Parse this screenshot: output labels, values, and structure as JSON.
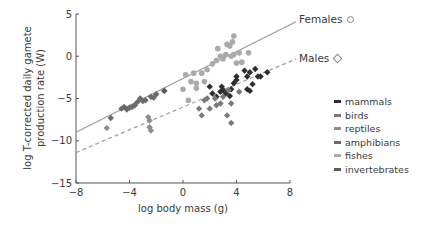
{
  "chart_data": {
    "type": "scatter",
    "title": "",
    "xlabel": "log body mass (g)",
    "ylabel_line1": "log T-corrected daily gamete",
    "ylabel_line2": "production rate  (W)",
    "xlim": [
      -8,
      8
    ],
    "ylim": [
      -15,
      5
    ],
    "xticks": [
      -8,
      -4,
      0,
      4,
      8
    ],
    "xtick_labels": [
      "−8",
      "−4",
      "0",
      "4",
      "8"
    ],
    "yticks": [
      5,
      0,
      -5,
      -10,
      -15
    ],
    "ytick_labels": [
      "5",
      "0",
      "−5",
      "−10",
      "−15"
    ],
    "grid": false,
    "legend_position": "right",
    "fit_lines": [
      {
        "name": "Females",
        "marker": "circle",
        "style": "solid",
        "color": "#9a9a9a",
        "x": [
          -8,
          8
        ],
        "y": [
          -9.0,
          3.6
        ]
      },
      {
        "name": "Males",
        "marker": "diamond",
        "style": "dashed",
        "color": "#a0a0a0",
        "x": [
          -8,
          8
        ],
        "y": [
          -11.4,
          -0.8
        ]
      }
    ],
    "series": [
      {
        "name": "mammals",
        "color": "#2e2e2e",
        "marker": "diamond",
        "points": [
          [
            2.0,
            -3.6
          ],
          [
            2.5,
            -4.8
          ],
          [
            2.8,
            -4.2
          ],
          [
            2.9,
            -3.6
          ],
          [
            3.2,
            -4.4
          ],
          [
            3.5,
            -4.7
          ],
          [
            3.6,
            -3.9
          ],
          [
            3.8,
            -3.2
          ],
          [
            4.0,
            -2.8
          ],
          [
            4.0,
            -2.4
          ],
          [
            4.6,
            -1.7
          ],
          [
            4.8,
            -2.4
          ],
          [
            4.8,
            -3.9
          ],
          [
            5.0,
            -4.1
          ],
          [
            5.0,
            -1.9
          ],
          [
            5.2,
            -3.3
          ],
          [
            5.4,
            -1.5
          ],
          [
            5.6,
            -2.4
          ],
          [
            5.8,
            -2.4
          ],
          [
            6.3,
            -1.9
          ],
          [
            2.2,
            -4.4
          ],
          [
            3.0,
            -4.0
          ]
        ]
      },
      {
        "name": "birds",
        "color": "#7a7a7a",
        "marker": "diamond",
        "points": [
          [
            1.4,
            -7.0
          ],
          [
            1.2,
            -6.2
          ],
          [
            1.6,
            -5.2
          ],
          [
            2.0,
            -6.2
          ],
          [
            2.5,
            -5.8
          ],
          [
            2.8,
            -5.6
          ],
          [
            3.3,
            -7.0
          ],
          [
            3.6,
            -7.9
          ],
          [
            3.6,
            -5.6
          ],
          [
            1.8,
            -5.0
          ],
          [
            2.4,
            -5.0
          ],
          [
            3.0,
            -4.8
          ],
          [
            3.4,
            -4.0
          ],
          [
            4.2,
            -4.2
          ]
        ]
      },
      {
        "name": "reptiles",
        "color": "#8c8c8c",
        "marker": "diamond",
        "points": [
          [
            -2.5,
            -7.6
          ],
          [
            -2.5,
            -8.4
          ],
          [
            -2.4,
            -8.8
          ],
          [
            -2.6,
            -7.2
          ],
          [
            -5.7,
            -8.5
          ],
          [
            -1.4,
            -4.1
          ]
        ]
      },
      {
        "name": "amphibians",
        "color": "#6a6a6a",
        "marker": "diamond",
        "points": [
          [
            -4.6,
            -6.2
          ],
          [
            -4.4,
            -6.0
          ],
          [
            -4.2,
            -6.3
          ],
          [
            -4.0,
            -6.1
          ],
          [
            -3.8,
            -6.0
          ],
          [
            -3.6,
            -5.8
          ],
          [
            -3.2,
            -5.0
          ],
          [
            -3.0,
            -5.3
          ],
          [
            -2.8,
            -5.2
          ],
          [
            -2.4,
            -4.8
          ],
          [
            -2.2,
            -4.9
          ],
          [
            -2.0,
            -4.5
          ],
          [
            -5.4,
            -7.3
          ],
          [
            -3.4,
            -5.4
          ]
        ]
      },
      {
        "name": "fishes",
        "color": "#aaaaaa",
        "marker": "circle",
        "points": [
          [
            0.2,
            -2.2
          ],
          [
            0.6,
            -3.0
          ],
          [
            1.0,
            -3.2
          ],
          [
            1.4,
            -2.0
          ],
          [
            1.8,
            -1.6
          ],
          [
            2.2,
            -0.9
          ],
          [
            2.5,
            -0.5
          ],
          [
            2.6,
            0.9
          ],
          [
            2.8,
            0.0
          ],
          [
            3.0,
            -0.3
          ],
          [
            3.2,
            0.2
          ],
          [
            3.3,
            1.4
          ],
          [
            3.5,
            1.2
          ],
          [
            3.6,
            0.0
          ],
          [
            3.7,
            1.7
          ],
          [
            3.8,
            0.2
          ],
          [
            3.8,
            2.4
          ],
          [
            4.0,
            -0.8
          ],
          [
            4.2,
            0.4
          ],
          [
            4.4,
            -0.7
          ],
          [
            4.9,
            0.4
          ],
          [
            0.0,
            -3.9
          ],
          [
            0.4,
            -5.2
          ],
          [
            1.0,
            -3.8
          ],
          [
            0.8,
            -2.0
          ],
          [
            1.6,
            -3.0
          ]
        ]
      },
      {
        "name": "invertebrates",
        "color": "#5a5a5a",
        "marker": "diamond",
        "points": [
          [
            -1.4,
            -4.1
          ]
        ]
      }
    ]
  },
  "legend": {
    "items": [
      {
        "label": "mammals",
        "color": "#2e2e2e"
      },
      {
        "label": "birds",
        "color": "#7a7a7a"
      },
      {
        "label": "reptiles",
        "color": "#8c8c8c"
      },
      {
        "label": "amphibians",
        "color": "#6a6a6a"
      },
      {
        "label": "fishes",
        "color": "#aaaaaa"
      },
      {
        "label": "invertebrates",
        "color": "#5a5a5a"
      }
    ]
  },
  "line_labels": {
    "females": "Females",
    "males": "Males"
  }
}
